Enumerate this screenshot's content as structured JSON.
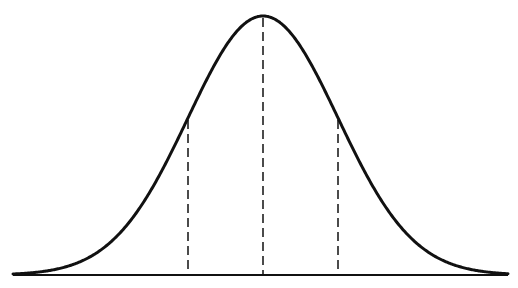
{
  "diagram": {
    "type": "normal-distribution-bell-curve",
    "colors": {
      "background": "#ffffff",
      "stroke": "#111111"
    },
    "baseline": {
      "x_start": 13,
      "x_end": 508,
      "y": 275
    },
    "curve": {
      "mean_x": 263,
      "peak_y": 16,
      "sigma_px": 75,
      "x_start": 13,
      "x_end": 508
    },
    "dashed_lines": [
      {
        "id": "minus-one-sigma",
        "x": 188
      },
      {
        "id": "mean",
        "x": 263
      },
      {
        "id": "plus-one-sigma",
        "x": 338
      }
    ]
  }
}
